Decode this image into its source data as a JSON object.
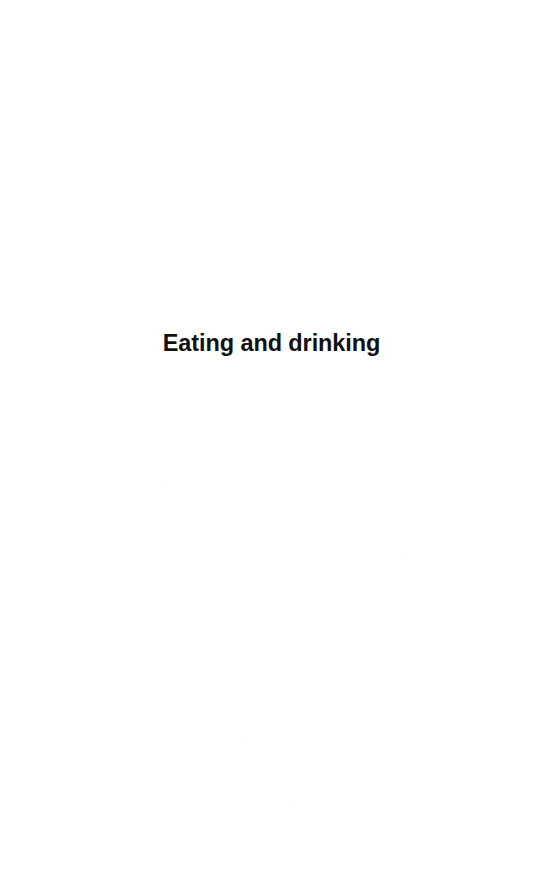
{
  "page": {
    "background_color": "#ffffff",
    "width_px": 543,
    "height_px": 886,
    "kind": "section-divider-page"
  },
  "content": {
    "section_title": "Eating and drinking",
    "title_color": "#111111",
    "title_align": "center"
  },
  "regions": {
    "blank_top_label": "",
    "blank_bottom_label": ""
  }
}
